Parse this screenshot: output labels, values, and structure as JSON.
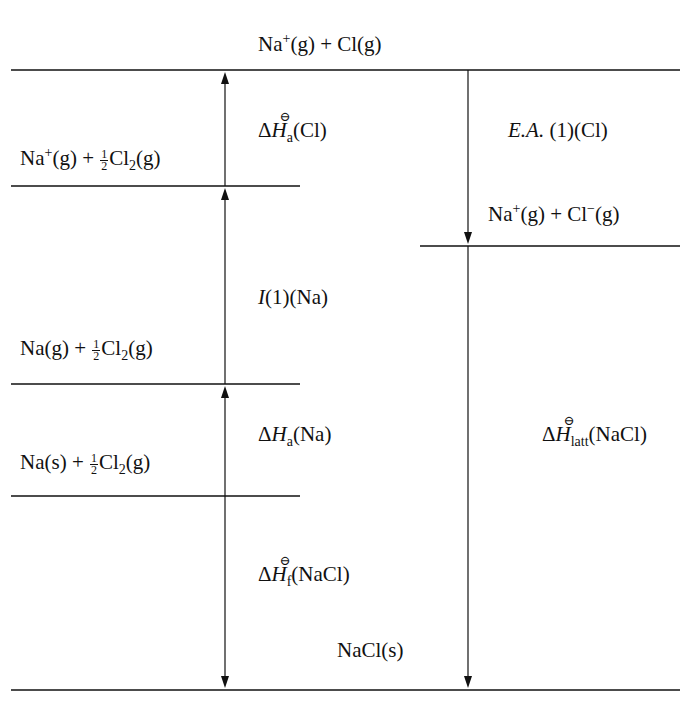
{
  "diagram": {
    "type": "Born-Haber cycle",
    "compound": "NaCl",
    "line_color": "#111111",
    "levels": [
      {
        "id": "top",
        "species": "Na+(g) + Cl(g)",
        "parts": {
          "a": "Na",
          "a_sup": "+",
          "b": "(g) + Cl(g)"
        }
      },
      {
        "id": "level2",
        "species": "Na+(g) + 1/2 Cl2(g)",
        "parts": {
          "a": "Na",
          "a_sup": "+",
          "b": "(g) + ",
          "num": "1",
          "den": "2",
          "c": "Cl",
          "c_sub": "2",
          "d": "(g)"
        }
      },
      {
        "id": "right",
        "species": "Na+(g) + Cl-(g)",
        "parts": {
          "a": "Na",
          "a_sup": "+",
          "b": "(g) + Cl",
          "b_sup": "−",
          "c": "(g)"
        }
      },
      {
        "id": "level3",
        "species": "Na(g) + 1/2 Cl2(g)",
        "parts": {
          "a": "Na(g) + ",
          "num": "1",
          "den": "2",
          "c": "Cl",
          "c_sub": "2",
          "d": "(g)"
        }
      },
      {
        "id": "level4",
        "species": "Na(s) + 1/2 Cl2(g)",
        "parts": {
          "a": "Na(s) + ",
          "num": "1",
          "den": "2",
          "c": "Cl",
          "c_sub": "2",
          "d": "(g)"
        }
      },
      {
        "id": "bottom",
        "species": "NaCl(s)",
        "parts": {
          "a": "NaCl(s)"
        }
      }
    ],
    "steps": [
      {
        "id": "atomisation_cl",
        "label": "ΔH⊖a(Cl)",
        "parts": {
          "delta": "Δ",
          "H": "H",
          "std": "⊖",
          "sub": "a",
          "rest": "(Cl)"
        },
        "direction": "up"
      },
      {
        "id": "ionisation_na",
        "label": "I(1)(Na)",
        "parts": {
          "I": "I",
          "rest": "(1)(Na)"
        },
        "direction": "up"
      },
      {
        "id": "atomisation_na",
        "label": "ΔHa(Na)",
        "parts": {
          "delta": "Δ",
          "H": "H",
          "sub": "a",
          "rest": "(Na)"
        },
        "direction": "up"
      },
      {
        "id": "formation",
        "label": "ΔH⊖f(NaCl)",
        "parts": {
          "delta": "Δ",
          "H": "H",
          "std": "⊖",
          "sub": "f",
          "rest": "(NaCl)"
        },
        "direction": "down"
      },
      {
        "id": "electron_affinity",
        "label": "E.A.(1)(Cl)",
        "parts": {
          "ea": "E.A.",
          "rest": " (1)(Cl)"
        },
        "direction": "down"
      },
      {
        "id": "lattice",
        "label": "ΔH⊖latt(NaCl)",
        "parts": {
          "delta": "Δ",
          "H": "H",
          "std": "⊖",
          "sub": "latt",
          "rest": "(NaCl)"
        },
        "direction": "down"
      }
    ]
  }
}
